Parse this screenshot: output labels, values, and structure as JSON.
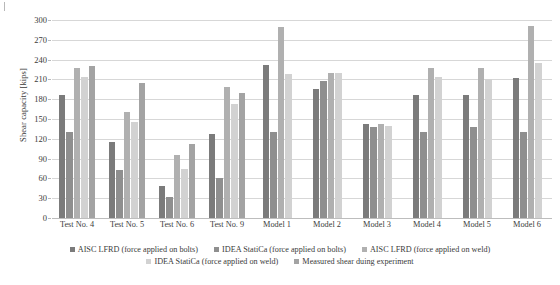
{
  "chart_data": {
    "type": "bar",
    "title": "",
    "xlabel": "",
    "ylabel": "Shear capacity [kips]",
    "ylim": [
      0,
      300
    ],
    "ytick_step": 30,
    "yticks": [
      0,
      30,
      60,
      90,
      120,
      150,
      180,
      210,
      240,
      270,
      300
    ],
    "grid": true,
    "legend_position": "bottom",
    "categories": [
      "Test No. 4",
      "Test No. 5",
      "Test No. 6",
      "Test No. 9",
      "Model 1",
      "Model 2",
      "Model 3",
      "Model 4",
      "Model 5",
      "Model 6"
    ],
    "series": [
      {
        "name": "AISC LFRD (force applied on bolts)",
        "color": "#7b7b7b",
        "values": [
          186,
          115,
          49,
          127,
          232,
          196,
          143,
          186,
          187,
          212
        ]
      },
      {
        "name": "IDEA StatiCa (force applied on bolts)",
        "color": "#8f8f8f",
        "values": [
          130,
          72,
          32,
          61,
          130,
          207,
          138,
          131,
          138,
          131
        ]
      },
      {
        "name": "AISC LFRD (force applied on weld)",
        "color": "#b0b0b0",
        "values": [
          228,
          161,
          95,
          199,
          290,
          220,
          142,
          228,
          228,
          291
        ]
      },
      {
        "name": "IDEA StatiCa (force applied on weld)",
        "color": "#d2d2d2",
        "values": [
          214,
          145,
          75,
          173,
          218,
          220,
          139,
          213,
          210,
          235
        ]
      },
      {
        "name": "Measured shear duing experiment",
        "color": "#a3a3a3",
        "values": [
          231,
          204,
          112,
          190,
          null,
          null,
          null,
          null,
          null,
          null
        ]
      }
    ]
  },
  "legend": {
    "items": [
      {
        "label": "AISC LFRD (force applied on bolts)",
        "color": "#7b7b7b"
      },
      {
        "label": "IDEA StatiCa (force applied on bolts)",
        "color": "#8f8f8f"
      },
      {
        "label": "AISC LFRD (force applied on weld)",
        "color": "#b0b0b0"
      },
      {
        "label": "IDEA StatiCa (force applied on weld)",
        "color": "#d2d2d2"
      },
      {
        "label": "Measured shear duing experiment",
        "color": "#a3a3a3"
      }
    ]
  }
}
